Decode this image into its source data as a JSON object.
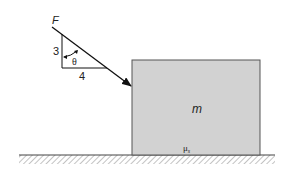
{
  "diagram": {
    "force_label": "F",
    "triangle": {
      "vertical_leg": "3",
      "horizontal_leg": "4",
      "angle": "θ"
    },
    "block": {
      "mass_label": "m",
      "friction_label": "μ",
      "friction_subscript": "s",
      "fill": "#d2d2d2"
    },
    "ground": {
      "color": "#555555"
    }
  }
}
